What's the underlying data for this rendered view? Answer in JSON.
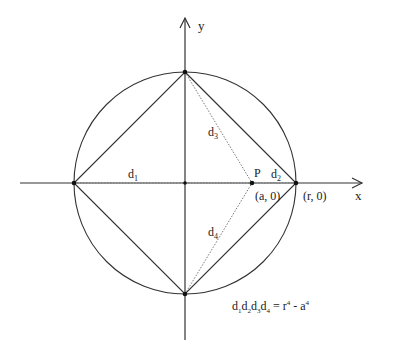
{
  "diagram": {
    "axes": {
      "x_label": "x",
      "y_label": "y"
    },
    "points": {
      "P": {
        "label": "P",
        "coord_label": "(a, 0)"
      },
      "R": {
        "coord_label": "(r, 0)"
      }
    },
    "distances": {
      "d1": {
        "base": "d",
        "sub": "1"
      },
      "d2": {
        "base": "d",
        "sub": "2"
      },
      "d3": {
        "base": "d",
        "sub": "3"
      },
      "d4": {
        "base": "d",
        "sub": "4"
      }
    },
    "equation": {
      "lhs": [
        {
          "base": "d",
          "sub": "1"
        },
        {
          "base": "d",
          "sub": "2"
        },
        {
          "base": "d",
          "sub": "3"
        },
        {
          "base": "d",
          "sub": "4"
        }
      ],
      "eq": " = ",
      "r": "r",
      "r_exp": "4",
      "minus": " - ",
      "a": "a",
      "a_exp": "4"
    },
    "colors": {
      "stroke": "#333333",
      "dotted": "#777777"
    }
  }
}
